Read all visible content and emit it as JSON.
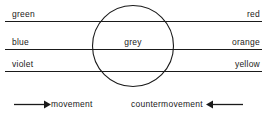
{
  "diagram": {
    "stroke_color": "#1a1a1a",
    "background_color": "#ffffff",
    "rows": [
      {
        "left_label": "green",
        "right_label": "red"
      },
      {
        "left_label": "blue",
        "right_label": "orange"
      },
      {
        "left_label": "violet",
        "right_label": "yellow"
      }
    ],
    "center_label": "grey",
    "legend": {
      "movement_label": "movement",
      "countermovement_label": "countermovement",
      "movement_arrow": "arrow-right-icon",
      "countermovement_arrow": "arrow-left-icon"
    },
    "shapes": {
      "circle_name": "grey-circle",
      "line_names": [
        "axis-line-green-red",
        "axis-line-blue-orange",
        "axis-line-violet-yellow"
      ]
    }
  }
}
